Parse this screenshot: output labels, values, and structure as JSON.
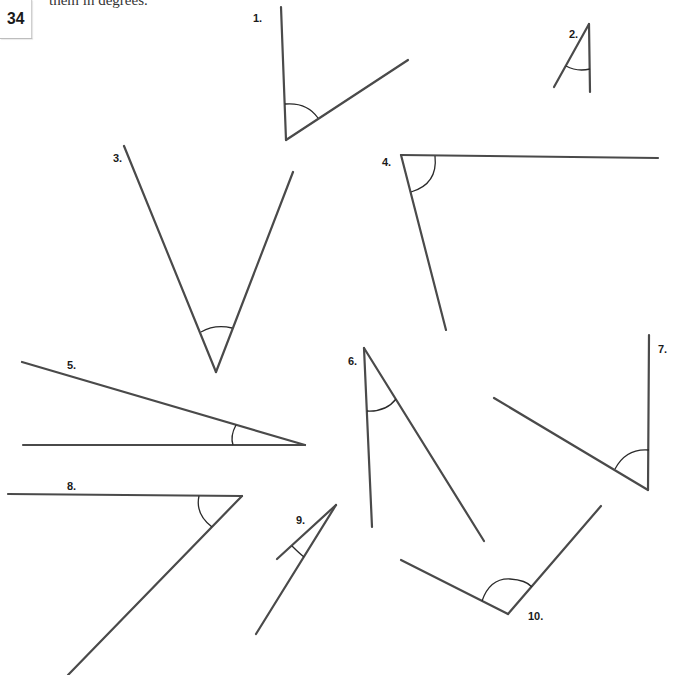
{
  "page": {
    "number": "34",
    "instruction_fragment": "them in degrees."
  },
  "colors": {
    "line": "#4a4a4a",
    "arc": "#2a2a2a",
    "text": "#1a1a1a",
    "background": "#ffffff"
  },
  "angles": [
    {
      "label": "1.",
      "kind": "obtuse-ish",
      "label_pos": [
        253,
        22
      ]
    },
    {
      "label": "2.",
      "kind": "acute",
      "label_pos": [
        570,
        38
      ]
    },
    {
      "label": "3.",
      "kind": "acute",
      "label_pos": [
        113,
        162
      ]
    },
    {
      "label": "4.",
      "kind": "acute",
      "label_pos": [
        382,
        165
      ]
    },
    {
      "label": "5.",
      "kind": "acute",
      "label_pos": [
        67,
        368
      ]
    },
    {
      "label": "6.",
      "kind": "acute",
      "label_pos": [
        348,
        365
      ]
    },
    {
      "label": "7.",
      "kind": "acute",
      "label_pos": [
        658,
        353
      ]
    },
    {
      "label": "8.",
      "kind": "acute",
      "label_pos": [
        67,
        490
      ]
    },
    {
      "label": "9.",
      "kind": "acute",
      "label_pos": [
        296,
        524
      ]
    },
    {
      "label": "10.",
      "kind": "obtuse",
      "label_pos": [
        528,
        619
      ]
    }
  ]
}
